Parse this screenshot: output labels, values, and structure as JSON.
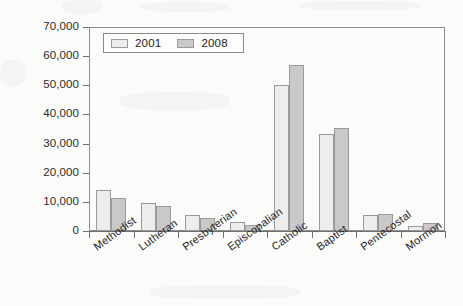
{
  "chart_data": {
    "type": "bar",
    "title": "",
    "subtitle": "",
    "xlabel": "",
    "ylabel": "",
    "ylim": [
      0,
      70000
    ],
    "ytick_labels": [
      "70,000",
      "60,000",
      "50,000",
      "40,000",
      "30,000",
      "20,000",
      "10,000",
      "0"
    ],
    "ytick_values": [
      70000,
      60000,
      50000,
      40000,
      30000,
      20000,
      10000,
      0
    ],
    "grid": false,
    "legend_position": "top-left",
    "categories": [
      "Methodist",
      "Lutheran",
      "Presbyterian",
      "Episcopalian",
      "Catholic",
      "Baptist",
      "Pentecostal",
      "Mormon"
    ],
    "series": [
      {
        "name": "2001",
        "color": "#ededed",
        "values": [
          14100,
          9600,
          5500,
          3100,
          50200,
          33300,
          5500,
          1700
        ]
      },
      {
        "name": "2008",
        "color": "#c9c9c9",
        "values": [
          11300,
          8600,
          4500,
          2100,
          57000,
          35400,
          5800,
          2700
        ]
      }
    ]
  },
  "legend": {
    "items": [
      {
        "label": "2001",
        "swatch": "legend-swatch-2001"
      },
      {
        "label": "2008",
        "swatch": "legend-swatch-2008"
      }
    ]
  },
  "colors": {
    "series_2001": "#ededed",
    "series_2008": "#c9c9c9",
    "axis": "#6f6f6f",
    "bar_outline": "#9a9a9a",
    "background": "#fbfbfa",
    "text": "#272727"
  }
}
